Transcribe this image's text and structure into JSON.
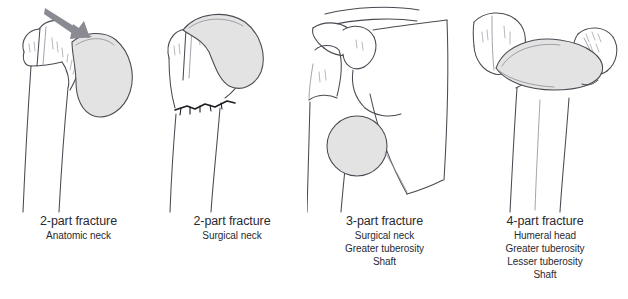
{
  "figure": {
    "background_color": "#ffffff",
    "text_color": "#2a2a33",
    "fragment_fill_color": "#e3e3e3",
    "outline_color": "#4a4a52",
    "fracture_line_color": "#1b1b20",
    "arrow_color": "#8a8a92"
  },
  "panels": [
    {
      "id": "panel-1",
      "title": "2-part fracture",
      "lines": [
        "Anatomic neck"
      ],
      "illustration": "proximal-humerus-anatomic-neck-fracture",
      "has_arrow": true,
      "shaded_fragment": "humeral-head"
    },
    {
      "id": "panel-2",
      "title": "2-part fracture",
      "lines": [
        "Surgical neck"
      ],
      "illustration": "proximal-humerus-surgical-neck-fracture",
      "has_arrow": false,
      "shaded_fragment": "humeral-head"
    },
    {
      "id": "panel-3",
      "title": "3-part fracture",
      "lines": [
        "Surgical neck",
        "Greater tuberosity",
        "Shaft"
      ],
      "illustration": "shoulder-girdle-three-part-fracture",
      "has_arrow": false,
      "shaded_fragment": "displaced-humeral-head"
    },
    {
      "id": "panel-4",
      "title": "4-part fracture",
      "lines": [
        "Humeral head",
        "Greater tuberosity",
        "Lesser tuberosity",
        "Shaft"
      ],
      "illustration": "proximal-humerus-four-part-fracture",
      "has_arrow": false,
      "shaded_fragment": "humeral-head"
    }
  ]
}
